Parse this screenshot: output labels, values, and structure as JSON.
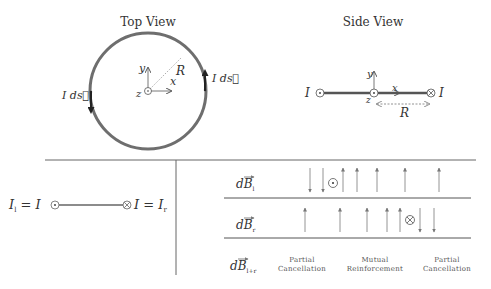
{
  "top_view": {
    "title": "Top View",
    "axis_x": "x",
    "axis_y": "y",
    "axis_z": "z",
    "radius_label": "R",
    "left_element_label": "I ds⃗",
    "right_element_label": "I ds⃗"
  },
  "side_view": {
    "title": "Side View",
    "left_current": "I",
    "right_current": "I",
    "axis_x": "x",
    "axis_y": "y",
    "axis_z": "z",
    "radius_label": "R"
  },
  "bottom_left": {
    "left_label": "I",
    "left_sub": "l",
    "left_eq": "= I",
    "right_eq": "I =",
    "right_label": "I",
    "right_sub": "r"
  },
  "field_rows": [
    {
      "label": "dB",
      "sub": "l",
      "symbol": "⊙"
    },
    {
      "label": "dB",
      "sub": "r",
      "symbol": "⊗"
    },
    {
      "label": "dB",
      "sub": "l+r"
    }
  ],
  "annotations": [
    {
      "line1": "Partial",
      "line2": "Cancellation"
    },
    {
      "line1": "Mutual",
      "line2": "Reinforcement"
    },
    {
      "line1": "Partial",
      "line2": "Cancellation"
    }
  ],
  "colors": {
    "stroke": "#555555",
    "loop": "#6e6e6e",
    "text": "#333333",
    "arrow": "#888888"
  }
}
